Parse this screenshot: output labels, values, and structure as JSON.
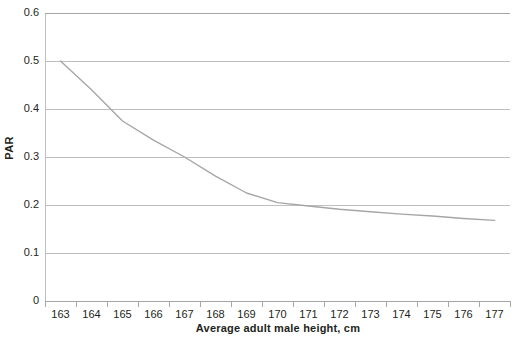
{
  "chart_data": {
    "type": "line",
    "title": "",
    "xlabel": "Average adult male height, cm",
    "ylabel": "PAR",
    "x": [
      163,
      164,
      165,
      166,
      167,
      168,
      169,
      170,
      171,
      172,
      173,
      174,
      175,
      176,
      177
    ],
    "categories": [
      "163",
      "164",
      "165",
      "166",
      "167",
      "168",
      "169",
      "170",
      "171",
      "172",
      "173",
      "174",
      "175",
      "176",
      "177"
    ],
    "values": [
      0.5,
      0.44,
      0.375,
      0.335,
      0.3,
      0.26,
      0.225,
      0.205,
      0.198,
      0.191,
      0.186,
      0.181,
      0.177,
      0.172,
      0.168
    ],
    "series": [
      {
        "name": "PAR",
        "color": "#a6a6a6",
        "values": [
          0.5,
          0.44,
          0.375,
          0.335,
          0.3,
          0.26,
          0.225,
          0.205,
          0.198,
          0.191,
          0.186,
          0.181,
          0.177,
          0.172,
          0.168
        ]
      }
    ],
    "xlim": [
      163,
      177
    ],
    "ylim": [
      0,
      0.6
    ],
    "ytick_labels": [
      "0.6",
      "0.5",
      "0.4",
      "0.3",
      "0.2",
      "0.1",
      "0"
    ],
    "ytick_values": [
      0.6,
      0.5,
      0.4,
      0.3,
      0.2,
      0.1,
      0
    ],
    "grid": "horizontal",
    "legend": "none",
    "gridline_color": "#bfbfbf",
    "axis_color": "#a6a6a6",
    "text_color": "#231f20",
    "background": "#ffffff"
  }
}
